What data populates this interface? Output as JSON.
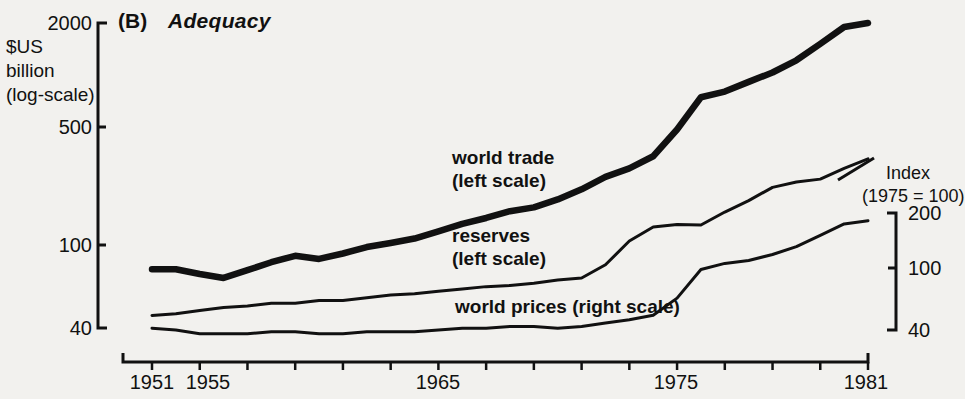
{
  "figure": {
    "panel_label": "(B)",
    "panel_title": "Adequacy"
  },
  "left_axis": {
    "caption_line1": "$US",
    "caption_line2": "billion",
    "caption_line3": "(log-scale)",
    "ticks": [
      {
        "label": "2000",
        "value": 2000,
        "y": 23
      },
      {
        "label": "500",
        "value": 500,
        "y": 127
      },
      {
        "label": "100",
        "value": 100,
        "y": 245
      },
      {
        "label": "40",
        "value": 40,
        "y": 328
      }
    ]
  },
  "right_axis": {
    "caption_line1": "Index",
    "caption_line2": "(1975 = 100)",
    "ticks": [
      {
        "label": "200",
        "value": 200,
        "y": 213
      },
      {
        "label": "100",
        "value": 100,
        "y": 268
      },
      {
        "label": "40",
        "value": 40,
        "y": 330
      }
    ]
  },
  "x_axis": {
    "ticks": [
      {
        "label": "1951",
        "value": 1951,
        "x": 152
      },
      {
        "label": "1955",
        "value": 1955,
        "x": 200
      },
      {
        "label": "1965",
        "value": 1965,
        "x": 438
      },
      {
        "label": "1975",
        "value": 1975,
        "x": 676
      },
      {
        "label": "1981",
        "value": 1981,
        "x": 868
      }
    ],
    "minor_tick_years": [
      1951,
      1953,
      1955,
      1957,
      1959,
      1961,
      1963,
      1965,
      1967,
      1969,
      1971,
      1973,
      1975,
      1977,
      1979,
      1981
    ]
  },
  "annotations": [
    {
      "name": "world-trade",
      "line1": "world trade",
      "line2": "(left scale)",
      "x": 452,
      "y": 146
    },
    {
      "name": "reserves",
      "line1": "reserves",
      "line2": "(left scale)",
      "x": 452,
      "y": 224
    },
    {
      "name": "world-prices",
      "line1": "world prices (right scale)",
      "line2": "",
      "x": 455,
      "y": 295
    }
  ],
  "colors": {
    "background": "#f2f1ee",
    "ink": "#111111",
    "world_trade": "#111111",
    "reserves": "#111111",
    "world_prices": "#111111"
  },
  "chart_data": {
    "type": "line",
    "title": "(B) Adequacy",
    "xlabel": "",
    "ylabel": "$US billion (log-scale)",
    "y2label": "Index (1975 = 100)",
    "log_scale": true,
    "ylim": [
      40,
      2000
    ],
    "y2lim": [
      40,
      200
    ],
    "xlim": [
      1951,
      1981
    ],
    "grid": false,
    "legend": "inline-annotations",
    "x": [
      1951,
      1952,
      1953,
      1954,
      1955,
      1956,
      1957,
      1958,
      1959,
      1960,
      1961,
      1962,
      1963,
      1964,
      1965,
      1966,
      1967,
      1968,
      1969,
      1970,
      1971,
      1972,
      1973,
      1974,
      1975,
      1976,
      1977,
      1978,
      1979,
      1980,
      1981
    ],
    "series": [
      {
        "name": "world trade (left scale)",
        "scale": "left",
        "units": "$US billion",
        "values": [
          85,
          85,
          80,
          76,
          84,
          93,
          101,
          97,
          104,
          113,
          119,
          126,
          138,
          152,
          164,
          179,
          188,
          208,
          237,
          278,
          310,
          362,
          510,
          772,
          830,
          940,
          1060,
          1240,
          1530,
          1900,
          2000
        ]
      },
      {
        "name": "reserves (left scale)",
        "scale": "left",
        "units": "$US billion",
        "values": [
          47,
          48,
          50,
          52,
          53,
          55,
          55,
          57,
          57,
          59,
          61,
          62,
          64,
          66,
          68,
          69,
          71,
          74,
          76,
          90,
          122,
          146,
          151,
          150,
          177,
          205,
          243,
          260,
          270,
          310,
          350
        ]
      },
      {
        "name": "world prices (right scale)",
        "scale": "right",
        "units": "Index (1975 = 100)",
        "values": [
          41,
          40,
          38,
          38,
          38,
          39,
          39,
          38,
          38,
          39,
          39,
          39,
          40,
          41,
          41,
          42,
          42,
          41,
          42,
          44,
          46,
          49,
          62,
          92,
          100,
          104,
          113,
          126,
          147,
          172,
          180
        ]
      }
    ]
  }
}
